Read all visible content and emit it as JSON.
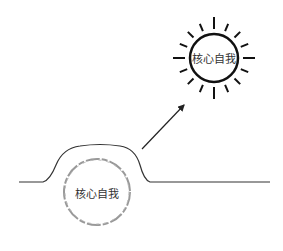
{
  "diagram": {
    "sun": {
      "label": "核心自我",
      "center": [
        214,
        58
      ],
      "radius": 24,
      "ray_count": 16,
      "color": "#111111"
    },
    "buried": {
      "label": "核心自我",
      "center": [
        97,
        192
      ],
      "radius": 33,
      "color": "#888888"
    },
    "arrow": {
      "from": [
        142,
        149
      ],
      "to": [
        185,
        104
      ]
    },
    "ground": {
      "y": 182,
      "color": "#333333"
    }
  }
}
